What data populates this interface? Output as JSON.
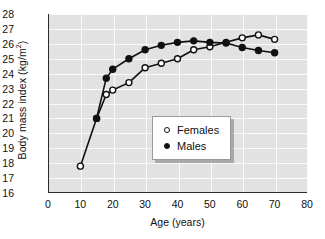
{
  "chart_data": {
    "type": "line",
    "title": "",
    "xlabel": "Age (years)",
    "ylabel": "Body mass index (kg/m²)",
    "ylabel_main": "Body mass index (kg/m",
    "ylabel_sup": "2",
    "ylabel_tail": ")",
    "xlim": [
      0,
      80
    ],
    "ylim": [
      16,
      28
    ],
    "xticks": [
      0,
      10,
      20,
      30,
      40,
      50,
      60,
      70,
      80
    ],
    "yticks": [
      16,
      17,
      18,
      19,
      20,
      21,
      22,
      23,
      24,
      25,
      26,
      27,
      28
    ],
    "grid": true,
    "grid_color": "#fafafa",
    "plot_bg": "#e2e2e2",
    "legend_position": "center",
    "series": [
      {
        "name": "Females",
        "marker": "open-circle",
        "color": "#111111",
        "x": [
          10,
          15,
          18,
          20,
          25,
          30,
          35,
          40,
          45,
          50,
          55,
          60,
          65,
          70
        ],
        "y": [
          17.8,
          21.0,
          22.6,
          22.9,
          23.4,
          24.4,
          24.7,
          25.0,
          25.6,
          25.8,
          26.1,
          26.4,
          26.6,
          26.3
        ]
      },
      {
        "name": "Males",
        "marker": "solid-circle",
        "color": "#111111",
        "x": [
          15,
          18,
          20,
          25,
          30,
          35,
          40,
          45,
          50,
          55,
          60,
          65,
          70
        ],
        "y": [
          21.0,
          23.7,
          24.3,
          25.0,
          25.6,
          25.9,
          26.1,
          26.2,
          26.1,
          26.05,
          25.75,
          25.55,
          25.4
        ]
      }
    ]
  },
  "legend": {
    "entries": [
      {
        "label": "Females",
        "marker": "open-circle"
      },
      {
        "label": "Males",
        "marker": "solid-circle"
      }
    ]
  }
}
